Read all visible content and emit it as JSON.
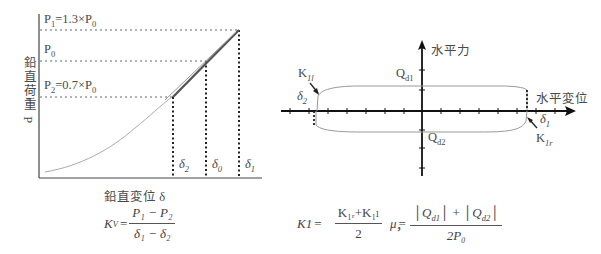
{
  "left_chart": {
    "y_axis_label": "鉛直荷重 P",
    "x_axis_label": "鉛直変位 δ",
    "levels": [
      {
        "name": "P1",
        "label_main": "P",
        "label_sub": "1",
        "label_rest": "=1.3×P",
        "label_sub2": "0"
      },
      {
        "name": "P0",
        "label_main": "P",
        "label_sub": "0",
        "label_rest": "",
        "label_sub2": ""
      },
      {
        "name": "P2",
        "label_main": "P",
        "label_sub": "2",
        "label_rest": "=0.7×P",
        "label_sub2": "0"
      }
    ],
    "displacements": [
      {
        "name": "δ2",
        "main": "δ",
        "sub": "2"
      },
      {
        "name": "δ0",
        "main": "δ",
        "sub": "0"
      },
      {
        "name": "δ1",
        "main": "δ",
        "sub": "1"
      }
    ]
  },
  "right_chart": {
    "y_axis_label": "水平力",
    "x_axis_label": "水平変位",
    "labels": {
      "qd1_main": "Q",
      "qd1_sub": "d1",
      "qd2_main": "Q",
      "qd2_sub": "d2",
      "k1l_main": "K",
      "k1l_sub": "1l",
      "k1r_main": "K",
      "k1r_sub": "1r",
      "d1_main": "δ",
      "d1_sub": "1",
      "d2_main": "δ",
      "d2_sub": "2"
    }
  },
  "formulas": {
    "kv": {
      "lhs_main": "K",
      "lhs_sub": "V",
      "eq": "=",
      "num": "P₁ − P₂",
      "den": "δ₁ − δ₂"
    },
    "k1": {
      "lhs": "K1",
      "eq": "=",
      "num": "K₁ᵣ+K₁ₗ",
      "den": "2",
      "sep": "，"
    },
    "mu": {
      "lhs": "μ",
      "eq": "=",
      "num": "|Q_d1| + |Q_d2|",
      "num_a_main": "Q",
      "num_a_sub": "d1",
      "num_plus": "+",
      "num_b_main": "Q",
      "num_b_sub": "d2",
      "den": "2P₀"
    }
  }
}
